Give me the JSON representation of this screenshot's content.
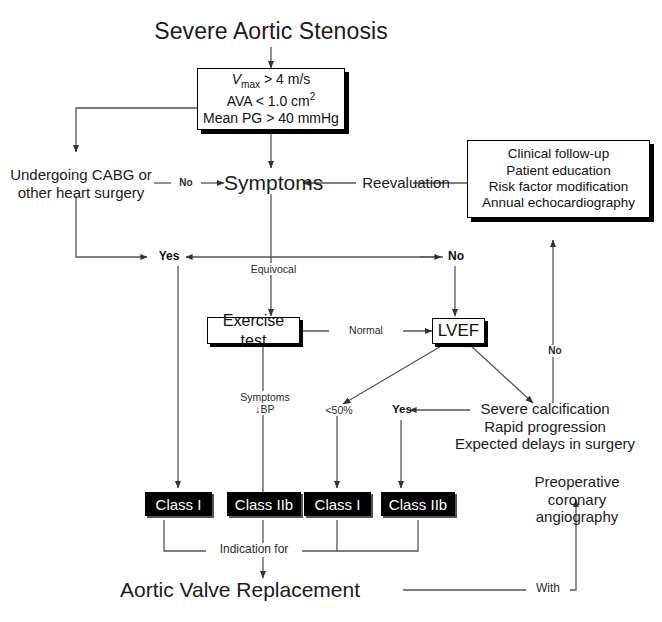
{
  "diagram": {
    "title": "Severe Aortic Stenosis",
    "type": "clinical-decision-flowchart"
  },
  "nodes": {
    "title": "Severe Aortic Stenosis",
    "criteria_box": {
      "line1_pre": "V",
      "line1_sub": "max",
      "line1_post": " > 4 m/s",
      "line2_pre": "AVA < 1.0 cm",
      "line2_sup": "2",
      "line3": "Mean PG > 40 mmHg"
    },
    "cabg": "Undergoing CABG or\nother heart surgery",
    "symptoms": "Symptoms",
    "reevaluation": "Reevaluation",
    "followup_box": "Clinical follow-up\nPatient education\nRisk factor modification\nAnnual echocardiography",
    "yes_junction": "Yes",
    "no_junction": "No",
    "exercise_test": "Exercise test",
    "lvef": "LVEF",
    "risk_factors": "Severe calcification\nRapid progression\nExpected delays in surgery",
    "yes_risk": "Yes",
    "class_1_a": "Class I",
    "class_2b_a": "Class IIb",
    "class_1_b": "Class I",
    "class_2b_b": "Class IIb",
    "avr": "Aortic Valve Replacement",
    "preop": "Preoperative\ncoronary\nangiography"
  },
  "edge_labels": {
    "no_cabg_to_symptoms": "No",
    "equivocal": "Equivocal",
    "normal": "Normal",
    "symptoms_bp": "Symptoms\n↓BP",
    "lt50": "<50%",
    "no_vertical": "No",
    "indication_for": "Indication for",
    "with": "With"
  },
  "colors": {
    "ink": "#111111",
    "line": "#555555",
    "box_fill": "#ffffff",
    "class_fill": "#000000",
    "class_text": "#ffffff",
    "background": "#ffffff"
  }
}
